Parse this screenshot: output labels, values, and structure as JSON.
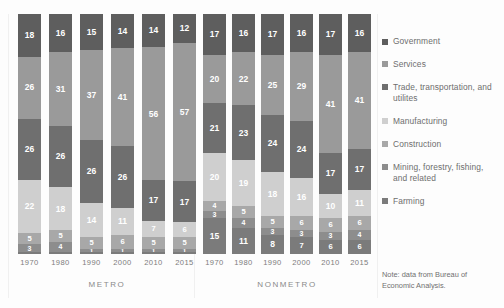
{
  "note": "Note: data from Bureau of Economic Analysis.",
  "groups": [
    {
      "name": "METRO",
      "years": [
        "1970",
        "1980",
        "1990",
        "2000",
        "2010",
        "2015"
      ]
    },
    {
      "name": "NONMETRO",
      "years": [
        "1970",
        "1980",
        "1990",
        "2000",
        "2010",
        "2015"
      ]
    }
  ],
  "legend": [
    {
      "label": "Government",
      "color": "#5e5e5e"
    },
    {
      "label": "Services",
      "color": "#9a9a9a"
    },
    {
      "label": "Trade, transportation, and utilites",
      "color": "#6f6f6f"
    },
    {
      "label": "Manufacturing",
      "color": "#cfcfcf"
    },
    {
      "label": "Construction",
      "color": "#a8a8a8"
    },
    {
      "label": "Mining, forestry, fishing, and related",
      "color": "#8d8d8d"
    },
    {
      "label": "Farming",
      "color": "#7b7b7b"
    }
  ],
  "chart_data": {
    "type": "bar",
    "title": "",
    "xlabel": "",
    "ylabel": "",
    "ylim": [
      0,
      100
    ],
    "stacked": true,
    "grid": false,
    "legend_position": "right",
    "categories": [
      "METRO 1970",
      "METRO 1980",
      "METRO 1990",
      "METRO 2000",
      "METRO 2010",
      "METRO 2015",
      "NONMETRO 1970",
      "NONMETRO 1980",
      "NONMETRO 1990",
      "NONMETRO 2000",
      "NONMETRO 2010",
      "NONMETRO 2015"
    ],
    "series": [
      {
        "name": "Government",
        "color": "#5e5e5e",
        "values": [
          18,
          16,
          15,
          14,
          14,
          12,
          17,
          16,
          17,
          16,
          17,
          16
        ]
      },
      {
        "name": "Services",
        "color": "#9a9a9a",
        "values": [
          26,
          31,
          37,
          41,
          56,
          57,
          20,
          22,
          25,
          29,
          41,
          41
        ]
      },
      {
        "name": "Trade, transportation, and utilites",
        "color": "#6f6f6f",
        "values": [
          26,
          26,
          26,
          26,
          17,
          17,
          21,
          23,
          24,
          24,
          17,
          17
        ]
      },
      {
        "name": "Manufacturing",
        "color": "#cfcfcf",
        "values": [
          22,
          18,
          14,
          11,
          7,
          6,
          20,
          19,
          18,
          16,
          10,
          11
        ]
      },
      {
        "name": "Construction",
        "color": "#a8a8a8",
        "values": [
          5,
          5,
          5,
          6,
          5,
          5,
          4,
          5,
          5,
          6,
          6,
          6
        ]
      },
      {
        "name": "Mining, forestry, fishing, and related",
        "color": "#8d8d8d",
        "values": [
          3,
          4,
          1,
          1,
          1,
          1,
          3,
          4,
          3,
          3,
          3,
          4
        ]
      },
      {
        "name": "Farming",
        "color": "#7b7b7b",
        "values": [
          1,
          1,
          1,
          1,
          1,
          1,
          15,
          11,
          8,
          7,
          6,
          6
        ]
      }
    ],
    "labels_shown": {
      "Government": [
        18,
        16,
        15,
        14,
        14,
        12,
        17,
        16,
        17,
        16,
        17,
        16
      ],
      "Services": [
        26,
        31,
        37,
        41,
        56,
        57,
        20,
        22,
        25,
        29,
        41,
        41
      ],
      "Trade, transportation, and utilites": [
        26,
        26,
        26,
        26,
        17,
        17,
        21,
        23,
        24,
        24,
        17,
        17
      ],
      "Manufacturing": [
        22,
        18,
        14,
        11,
        7,
        6,
        20,
        19,
        18,
        16,
        10,
        11
      ],
      "Construction": [
        5,
        5,
        5,
        6,
        5,
        5,
        4,
        5,
        5,
        6,
        6,
        6
      ],
      "Mining, forestry, fishing, and related": [
        3,
        4,
        1,
        1,
        1,
        1,
        3,
        4,
        3,
        3,
        3,
        4
      ],
      "Farming": [
        null,
        null,
        null,
        null,
        null,
        null,
        15,
        11,
        8,
        7,
        6,
        6
      ]
    }
  }
}
